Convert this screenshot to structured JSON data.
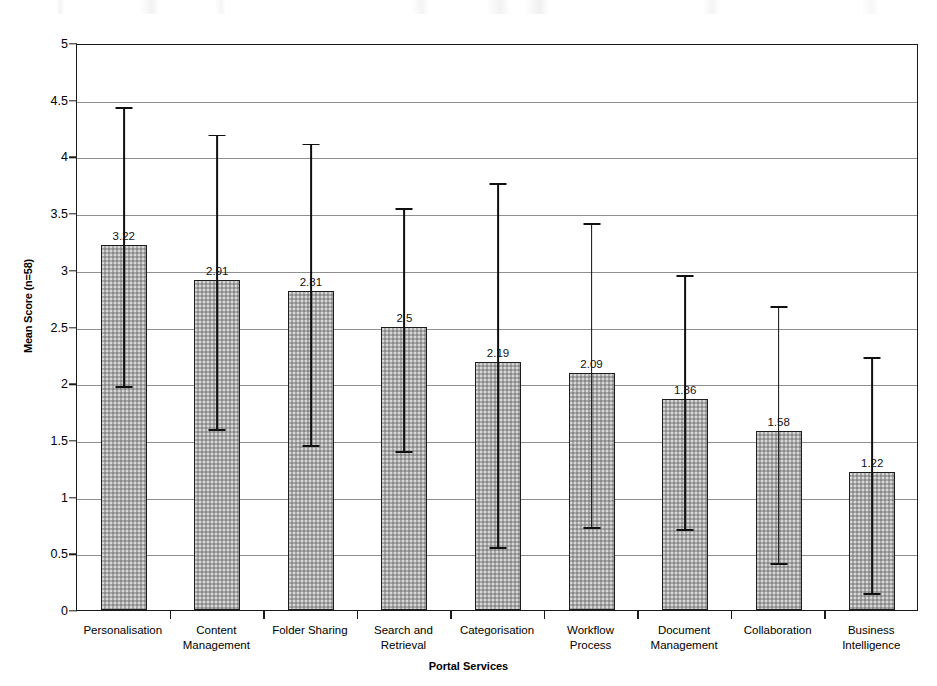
{
  "chart_data": {
    "type": "bar",
    "title": "",
    "subtitle": "",
    "xlabel": "Portal Services",
    "ylabel": "Mean Score (n=58)",
    "ylim": [
      0,
      5
    ],
    "yticks": [
      "0",
      "0.5",
      "1",
      "1.5",
      "2",
      "2.5",
      "3",
      "3.5",
      "4",
      "4.5",
      "5"
    ],
    "ytick_values": [
      0,
      0.5,
      1,
      1.5,
      2,
      2.5,
      3,
      3.5,
      4,
      4.5,
      5
    ],
    "grid": "horizontal",
    "legend": "none",
    "error_bars": "yes",
    "categories": [
      "Personalisation",
      "Content Management",
      "Folder Sharing",
      "Search and Retrieval",
      "Categorisation",
      "Workflow Process",
      "Document Management",
      "Collaboration",
      "Business Intelligence"
    ],
    "category_lines": [
      [
        "Personalisation"
      ],
      [
        "Content",
        "Management"
      ],
      [
        "Folder Sharing"
      ],
      [
        "Search and",
        "Retrieval"
      ],
      [
        "Categorisation"
      ],
      [
        "Workflow",
        "Process"
      ],
      [
        "Document",
        "Management"
      ],
      [
        "Collaboration"
      ],
      [
        "Business",
        "Intelligence"
      ]
    ],
    "values": [
      3.22,
      2.91,
      2.81,
      2.5,
      2.19,
      2.09,
      1.86,
      1.58,
      1.22
    ],
    "value_labels": [
      "3.22",
      "2.91",
      "2.81",
      "2.5",
      "2.19",
      "2.09",
      "1.86",
      "1.58",
      "1.22"
    ],
    "error_low": [
      1.99,
      1.61,
      1.47,
      1.42,
      0.57,
      0.75,
      0.73,
      0.43,
      0.17
    ],
    "error_high": [
      4.45,
      4.21,
      4.13,
      3.56,
      3.78,
      3.43,
      2.97,
      2.7,
      2.25
    ],
    "bar_color": "#a8a8a8",
    "bar_edge_color": "#1d1d1d",
    "error_color": "#101010",
    "grid_color": "#8f8f8f",
    "frame_color": "#1a1a1a"
  }
}
